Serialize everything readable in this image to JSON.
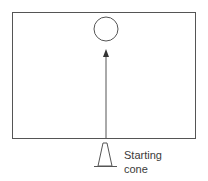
{
  "diagram": {
    "field": {
      "x": 12,
      "y": 12,
      "width": 183,
      "height": 126
    },
    "target": {
      "cx": 106,
      "cy": 29,
      "r": 12
    },
    "arrow": {
      "x": 106,
      "y_start": 138,
      "y_end": 50
    },
    "cone": {
      "apex_x": 105,
      "apex_y": 143,
      "base_left": 97,
      "base_right": 113,
      "base_y": 166
    },
    "label_lines": [
      "Starting",
      "cone"
    ],
    "stroke_color": "#555555"
  }
}
